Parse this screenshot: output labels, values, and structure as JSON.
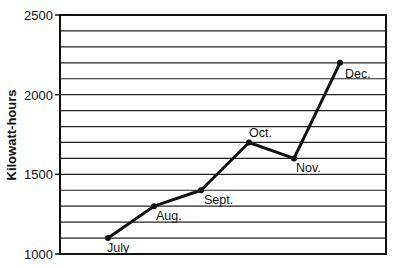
{
  "chart_data": {
    "type": "line",
    "title": "",
    "xlabel": "",
    "ylabel": "Kilowatt-hours",
    "categories": [
      "July",
      "Aug.",
      "Sept.",
      "Oct.",
      "Nov.",
      "Dec."
    ],
    "values": [
      1100,
      1300,
      1400,
      1700,
      1600,
      2200
    ],
    "ylim": [
      1000,
      2500
    ],
    "yticks": [
      1000,
      1500,
      2000,
      2500
    ],
    "grid_step": 100,
    "grid": true,
    "legend": "none",
    "point_labels": [
      "July",
      "Aug.",
      "Sept.",
      "Oct.",
      "Nov.",
      "Dec."
    ],
    "colors": {
      "line": "#111111",
      "grid": "#222222",
      "background": "#ffffff"
    }
  }
}
